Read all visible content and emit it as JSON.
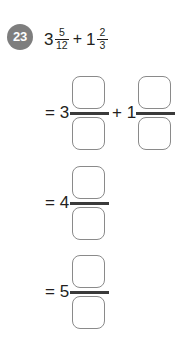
{
  "problem": {
    "number": "23",
    "expression": {
      "term1": {
        "whole": "3",
        "numerator": "5",
        "denominator": "12"
      },
      "operator": "+",
      "term2": {
        "whole": "1",
        "numerator": "2",
        "denominator": "3"
      }
    }
  },
  "solution_rows": [
    {
      "terms": [
        {
          "lead": "= 3",
          "numerator_value": "",
          "denominator_value": ""
        },
        {
          "lead": "+ 1",
          "numerator_value": "",
          "denominator_value": ""
        }
      ]
    },
    {
      "terms": [
        {
          "lead": "= 4",
          "numerator_value": "",
          "denominator_value": ""
        }
      ]
    },
    {
      "terms": [
        {
          "lead": "= 5",
          "numerator_value": "",
          "denominator_value": ""
        }
      ]
    }
  ],
  "colors": {
    "badge_background": "#7e7e7e",
    "badge_text": "#ffffff",
    "text": "#231f20",
    "box_border": "#8a8a8a",
    "fraction_bar": "#3a3a3a",
    "page_background": "#ffffff"
  }
}
